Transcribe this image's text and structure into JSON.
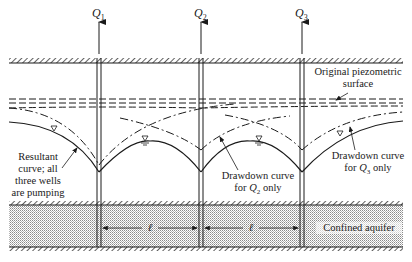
{
  "diagram": {
    "wells": [
      {
        "id": "Q1",
        "label": "Q",
        "subscript": "1",
        "x": 99
      },
      {
        "id": "Q2",
        "label": "Q",
        "subscript": "2",
        "x": 201
      },
      {
        "id": "Q3",
        "label": "Q",
        "subscript": "3",
        "x": 302
      }
    ],
    "labels": {
      "original_surface_line1": "Original piezometric",
      "original_surface_line2": "surface",
      "resultant_line1": "Resultant",
      "resultant_line2": "curve; all",
      "resultant_line3": "three wells",
      "resultant_line4": "are pumping",
      "drawdown_q2_line1": "Drawdown curve",
      "drawdown_q2_prefix": "for ",
      "drawdown_q2_sym": "Q",
      "drawdown_q2_sub": "2",
      "drawdown_q2_suffix": " only",
      "drawdown_q3_line1": "Drawdown curve",
      "drawdown_q3_prefix": "for ",
      "drawdown_q3_sym": "Q",
      "drawdown_q3_sub": "3",
      "drawdown_q3_suffix": " only",
      "confined_aquifer": "Confined aquifer",
      "spacing_symbol": "ℓ"
    },
    "colors": {
      "line": "#1a1a1a",
      "aquifer_fill": "#d9d9d9",
      "background": "#ffffff"
    }
  }
}
